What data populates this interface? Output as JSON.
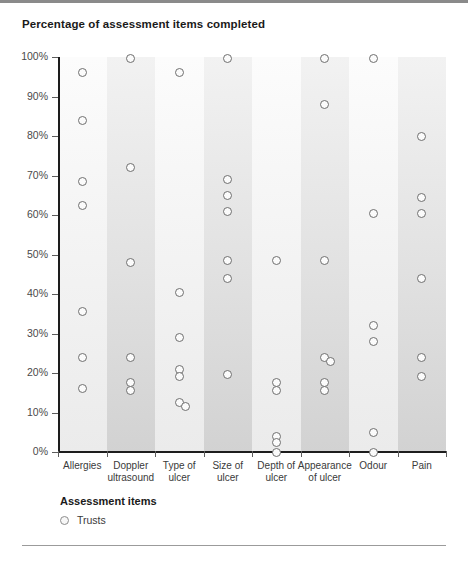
{
  "chart_data": {
    "type": "scatter",
    "title": "Percentage of assessment items completed",
    "xlabel": "Assessment items",
    "ylabel": "",
    "ylim": [
      0,
      100
    ],
    "grid": false,
    "legend_position": "bottom-left",
    "legend": [
      "Trusts"
    ],
    "y_ticks": [
      "0%",
      "10%",
      "20%",
      "30%",
      "40%",
      "50%",
      "60%",
      "70%",
      "80%",
      "90%",
      "100%"
    ],
    "y_tick_values": [
      0,
      10,
      20,
      30,
      40,
      50,
      60,
      70,
      80,
      90,
      100
    ],
    "categories": [
      "Allergies",
      "Doppler ultrasound",
      "Type of ulcer",
      "Size of ulcer",
      "Depth of ulcer",
      "Appearance of ulcer",
      "Odour",
      "Pain"
    ],
    "category_lines": [
      [
        "Allergies"
      ],
      [
        "Doppler",
        "ultrasound"
      ],
      [
        "Type of",
        "ulcer"
      ],
      [
        "Size of",
        "ulcer"
      ],
      [
        "Depth of",
        "ulcer"
      ],
      [
        "Appearance",
        "of ulcer"
      ],
      [
        "Odour"
      ],
      [
        "Pain"
      ]
    ],
    "series": [
      {
        "name": "Trusts",
        "points_by_category": [
          [
            96,
            84,
            68.5,
            62.5,
            35.5,
            24,
            16
          ],
          [
            99.5,
            72,
            48,
            24,
            17.5,
            15.5
          ],
          [
            96,
            40.5,
            29,
            21,
            19,
            12.5,
            11.5
          ],
          [
            99.5,
            69,
            65,
            61,
            48.5,
            44,
            19.5
          ],
          [
            48.5,
            17.5,
            15.5,
            4,
            2.5,
            0
          ],
          [
            99.5,
            88,
            48.5,
            24,
            23,
            17.5,
            15.5
          ],
          [
            99.5,
            60.5,
            32,
            28,
            5,
            0
          ],
          [
            80,
            64.5,
            60.5,
            44,
            24,
            19
          ]
        ]
      }
    ]
  },
  "legend": {
    "title": "Assessment items",
    "entry": "Trusts"
  }
}
